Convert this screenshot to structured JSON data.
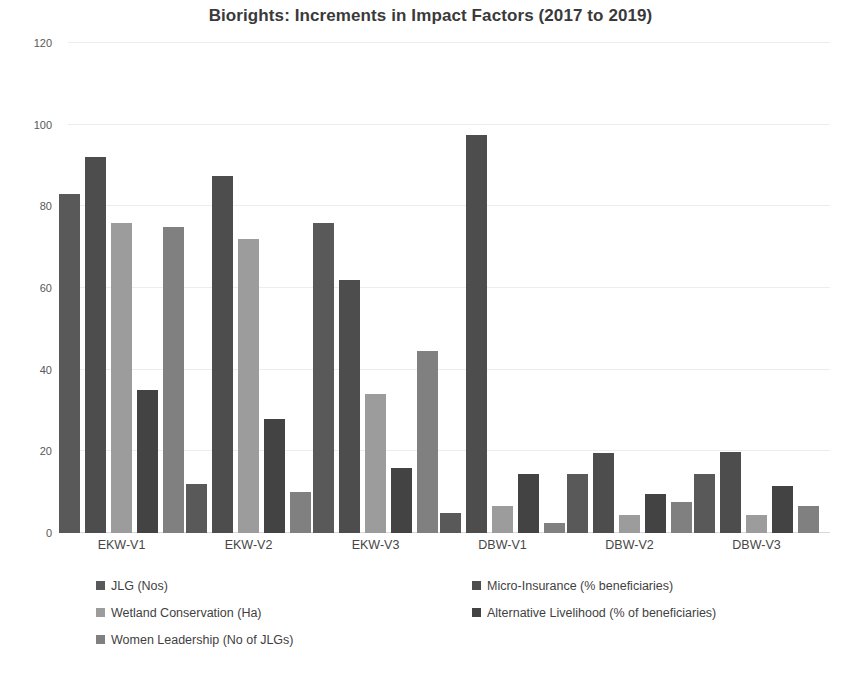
{
  "chart_data": {
    "type": "bar",
    "title": "Biorights: Increments in Impact Factors (2017 to 2019)",
    "xlabel": "",
    "ylabel": "",
    "ylim": [
      0,
      120
    ],
    "yticks": [
      0,
      20,
      40,
      60,
      80,
      100,
      120
    ],
    "ytick_labels": [
      "0",
      "20",
      "40",
      "60",
      "80",
      "100",
      "120"
    ],
    "grid": true,
    "legend_position": "bottom",
    "categories": [
      "EKW-V1",
      "EKW-V2",
      "EKW-V3",
      "DBW-V1",
      "DBW-V2",
      "DBW-V3"
    ],
    "series": [
      {
        "name": "JLG (Nos)",
        "color": "#595959",
        "values": [
          83,
          12,
          76,
          5,
          14.5,
          14.5
        ]
      },
      {
        "name": "Micro-Insurance (% beneficiaries)",
        "color": "#4d4d4d",
        "values": [
          92,
          87.5,
          62,
          97.5,
          19.7,
          19.8
        ]
      },
      {
        "name": "Wetland Conservation (Ha)",
        "color": "#9c9c9c",
        "values": [
          76,
          72,
          34,
          6.5,
          4.5,
          4.5
        ]
      },
      {
        "name": "Alternative Livelihood (% of beneficiaries)",
        "color": "#434343",
        "values": [
          35,
          28,
          16,
          14.5,
          9.5,
          11.5
        ]
      },
      {
        "name": "Women Leadership (No of JLGs)",
        "color": "#808080",
        "values": [
          75,
          10,
          44.5,
          2.5,
          7.5,
          6.5
        ]
      }
    ],
    "legend_layout": {
      "left_column": [
        "JLG (Nos)",
        "Wetland Conservation (Ha)",
        "Women Leadership (No of JLGs)"
      ],
      "right_column": [
        "Micro-Insurance (% beneficiaries)",
        "Alternative Livelihood (% of beneficiaries)"
      ]
    }
  }
}
